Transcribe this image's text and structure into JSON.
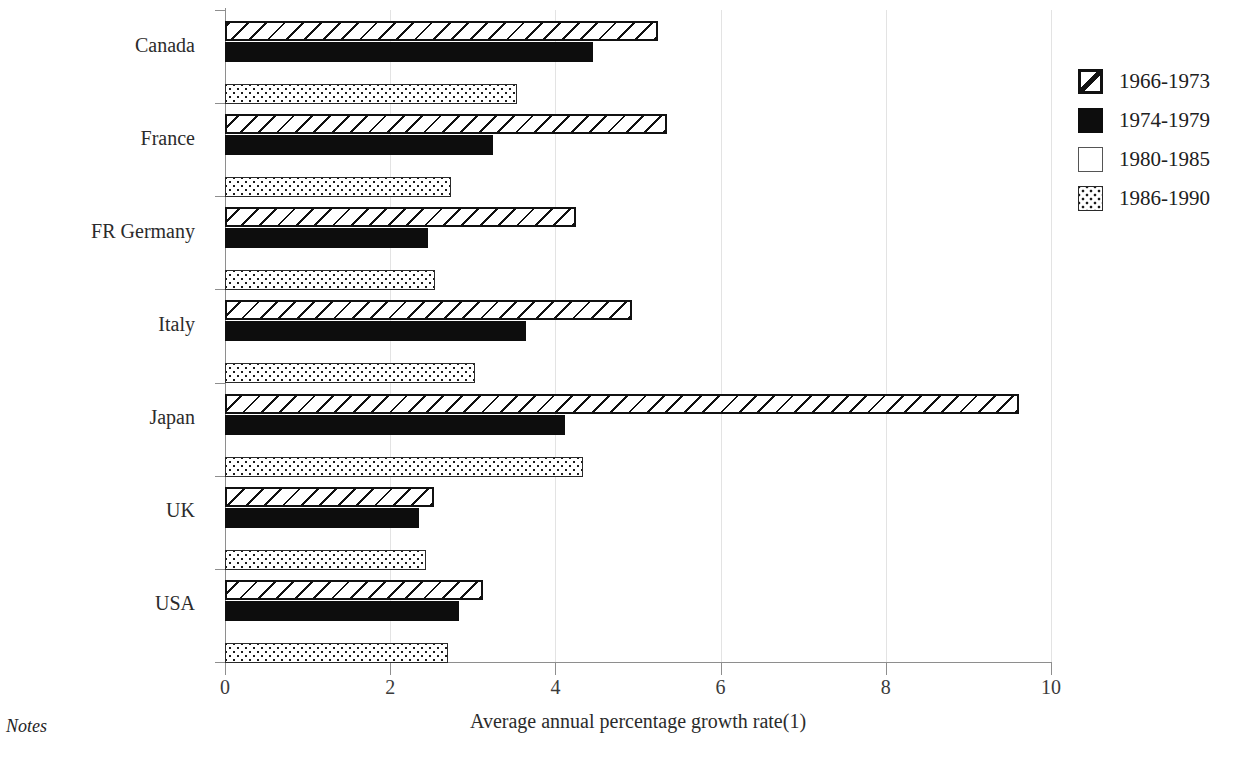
{
  "notes_label": "Notes",
  "legend": {
    "position": "right",
    "entries": [
      {
        "label": "1966-1973",
        "pattern": "diagonal-hatch",
        "color": "#111111"
      },
      {
        "label": "1974-1979",
        "pattern": "solid",
        "color": "#0d0d0d"
      },
      {
        "label": "1980-1985",
        "pattern": "empty",
        "color": "#ffffff"
      },
      {
        "label": "1986-1990",
        "pattern": "dotted",
        "color": "#1b1b1b"
      }
    ]
  },
  "chart_data": {
    "type": "bar",
    "orientation": "horizontal",
    "title": "",
    "xlabel": "Average annual percentage growth rate(1)",
    "ylabel": "",
    "xlim": [
      0,
      10
    ],
    "xticks": [
      0,
      2,
      4,
      6,
      8,
      10
    ],
    "xtick_labels": [
      "0",
      "2",
      "4",
      "6",
      "8",
      "10"
    ],
    "grid": true,
    "categories": [
      "Canada",
      "France",
      "FR Germany",
      "Italy",
      "Japan",
      "UK",
      "USA"
    ],
    "series": [
      {
        "name": "1966-1973",
        "values": [
          5.24,
          5.35,
          4.25,
          4.93,
          9.61,
          2.53,
          3.12
        ]
      },
      {
        "name": "1974-1979",
        "values": [
          4.46,
          3.25,
          2.46,
          3.64,
          4.12,
          2.35,
          2.83
        ]
      },
      {
        "name": "1980-1985",
        "values": [
          0,
          0,
          0,
          0,
          0,
          0,
          0
        ]
      },
      {
        "name": "1986-1990",
        "values": [
          3.53,
          2.74,
          2.54,
          3.03,
          4.33,
          2.43,
          2.7
        ]
      }
    ]
  }
}
